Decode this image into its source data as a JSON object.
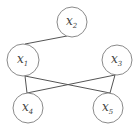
{
  "diagram": {
    "type": "graph",
    "nodes": [
      {
        "id": "x2",
        "base": "x",
        "sub": "2",
        "cx": 72,
        "cy": 22,
        "r": 15
      },
      {
        "id": "x1",
        "base": "x",
        "sub": "1",
        "cx": 23,
        "cy": 60,
        "r": 16
      },
      {
        "id": "x3",
        "base": "x",
        "sub": "3",
        "cx": 117,
        "cy": 60,
        "r": 15
      },
      {
        "id": "x4",
        "base": "x",
        "sub": "4",
        "cx": 28,
        "cy": 108,
        "r": 15
      },
      {
        "id": "x5",
        "base": "x",
        "sub": "5",
        "cx": 108,
        "cy": 108,
        "r": 15
      }
    ],
    "edges": [
      {
        "from": "x2",
        "to": "x1",
        "x1": 67,
        "y1": 36,
        "x2": 25,
        "y2": 44
      },
      {
        "from": "x1",
        "to": "x4",
        "x1": 25,
        "y1": 76,
        "x2": 27,
        "y2": 93
      },
      {
        "from": "x1",
        "to": "x5",
        "x1": 25,
        "y1": 76,
        "x2": 110,
        "y2": 93
      },
      {
        "from": "x3",
        "to": "x4",
        "x1": 115,
        "y1": 75,
        "x2": 27,
        "y2": 93
      },
      {
        "from": "x3",
        "to": "x5",
        "x1": 115,
        "y1": 75,
        "x2": 110,
        "y2": 93
      }
    ]
  }
}
